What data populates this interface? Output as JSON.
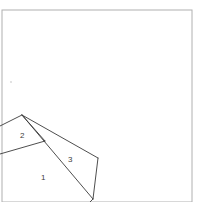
{
  "figure": {
    "type": "line-drawing",
    "background_color": "#ffffff",
    "stroke_color": "#3a3a3a",
    "border_color": "#b0b0b0",
    "label_color": "#3c3c3c",
    "canvas": {
      "width": 204,
      "height": 202
    },
    "page_border": {
      "name": "page-border",
      "x": 2,
      "y": 10,
      "width": 190,
      "height": 192,
      "color": "#b0b0b0",
      "stroke_width": 1
    },
    "speck": {
      "name": "faint-speck",
      "cx": 11,
      "cy": 82,
      "r": 1.1,
      "color": "#dcdcdc"
    },
    "apex": {
      "x": 22,
      "y": 115
    },
    "strokes": [
      {
        "name": "horizontal-edge",
        "points": "0,126 22,115"
      },
      {
        "name": "wedge-upper-edge",
        "points": "22,115 98,158"
      },
      {
        "name": "wedge-lower-edge",
        "points": "22,115 93,199"
      },
      {
        "name": "wedge-mid-edge",
        "points": "22,115 45,141"
      },
      {
        "name": "left-lower-edge",
        "points": "45,141 0,154"
      },
      {
        "name": "right-side-edge",
        "points": "98,158 93,199"
      },
      {
        "name": "bottom-spur",
        "points": "93,199 90,202"
      }
    ],
    "labels": [
      {
        "name": "region-label-1",
        "text": "1",
        "x": 41,
        "y": 180
      },
      {
        "name": "region-label-2",
        "text": "2",
        "x": 20,
        "y": 138
      },
      {
        "name": "region-label-3",
        "text": "3",
        "x": 68,
        "y": 162
      }
    ]
  }
}
